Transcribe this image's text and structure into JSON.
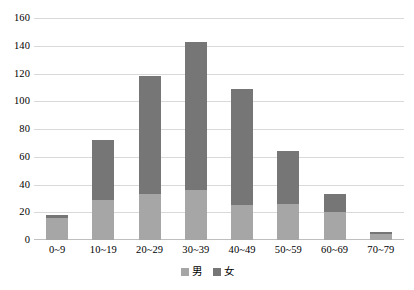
{
  "chart_data": {
    "type": "bar",
    "subtype": "stacked-vertical",
    "title": "",
    "xlabel": "",
    "ylabel": "",
    "ylim": [
      0,
      160
    ],
    "ytick_step": 20,
    "yticks": [
      160,
      140,
      120,
      100,
      80,
      60,
      40,
      20,
      0
    ],
    "grid": true,
    "legend_position": "bottom-center",
    "categories": [
      "0~9",
      "10~19",
      "20~29",
      "30~39",
      "40~49",
      "50~59",
      "60~69",
      "70~79"
    ],
    "series": [
      {
        "name": "男",
        "color": "#a6a6a6",
        "values": [
          16,
          29,
          33,
          36,
          25,
          26,
          20,
          4
        ]
      },
      {
        "name": "女",
        "color": "#767676",
        "values": [
          2,
          43,
          85,
          107,
          84,
          38,
          13,
          2
        ]
      }
    ],
    "totals": [
      18,
      72,
      118,
      143,
      109,
      64,
      33,
      6
    ]
  },
  "legend": {
    "items": [
      {
        "label": "男",
        "color": "#a6a6a6"
      },
      {
        "label": "女",
        "color": "#767676"
      }
    ]
  },
  "axis": {
    "y_labels": [
      "160",
      "140",
      "120",
      "100",
      "80",
      "60",
      "40",
      "20",
      "0"
    ],
    "x_labels": [
      "0~9",
      "10~19",
      "20~29",
      "30~39",
      "40~49",
      "50~59",
      "60~69",
      "70~79"
    ]
  },
  "colors": {
    "male": "#a6a6a6",
    "female": "#767676",
    "gridline": "#d9d9d9",
    "background": "#ffffff",
    "text": "#000000"
  }
}
